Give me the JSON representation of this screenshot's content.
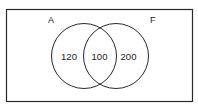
{
  "diagram": {
    "type": "venn",
    "universe_box": true,
    "sets": [
      {
        "label": "A",
        "only_value": "120"
      },
      {
        "label": "F",
        "only_value": "200"
      }
    ],
    "intersection_value": "100",
    "colors": {
      "stroke": "#2a2a2a",
      "text": "#222222",
      "background": "#ffffff"
    }
  }
}
